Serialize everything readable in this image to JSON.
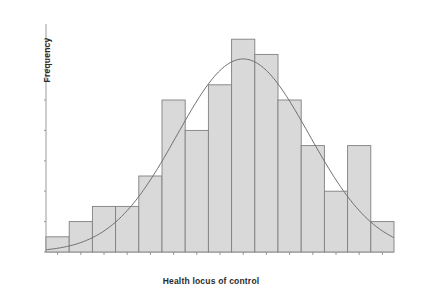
{
  "chart_data": {
    "type": "bar",
    "title": "",
    "xlabel": "Health locus of control",
    "ylabel": "Frequency",
    "categories": [
      "0",
      "1",
      "2",
      "3",
      "4",
      "5",
      "6",
      "7",
      "8",
      "9",
      "10",
      "11",
      "12",
      "13",
      "14"
    ],
    "values": [
      1,
      2,
      3,
      3,
      5,
      10,
      8,
      11,
      14,
      13,
      10,
      7,
      4,
      7,
      2
    ],
    "xlim": [
      -0.5,
      14.5
    ],
    "ylim": [
      0,
      15
    ],
    "yticks": [
      0,
      2,
      4,
      6,
      8,
      10,
      12,
      14
    ],
    "xticks": [
      "0",
      "1",
      "2",
      "3",
      "4",
      "5",
      "6",
      "7",
      "8",
      "9",
      "10",
      "11",
      "12",
      "13",
      "14"
    ],
    "grid": false,
    "legend": null,
    "bar_fill": "#d9d9d9",
    "bar_edge": "#808080",
    "overlay": {
      "type": "line",
      "name": "normal-curve",
      "color": "#6e6e6e",
      "mean": 8.0,
      "sigma": 2.85,
      "peak": 12.7
    }
  },
  "axes": {
    "y_axis_title": "Frequency",
    "x_axis_title": "Health locus of control"
  }
}
